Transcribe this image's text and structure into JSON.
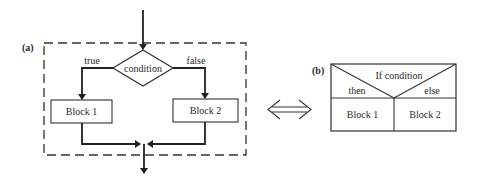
{
  "figure_a": {
    "label": "(a)",
    "decision": "condition",
    "true_label": "true",
    "false_label": "false",
    "block1": "Block 1",
    "block2": "Block 2"
  },
  "equivalence_symbol": "double-arrow",
  "figure_b": {
    "label": "(b)",
    "header": "If condition",
    "then_label": "then",
    "else_label": "else",
    "block1": "Block 1",
    "block2": "Block 2"
  },
  "colors": {
    "line": "#222222",
    "background": "#ffffff"
  }
}
